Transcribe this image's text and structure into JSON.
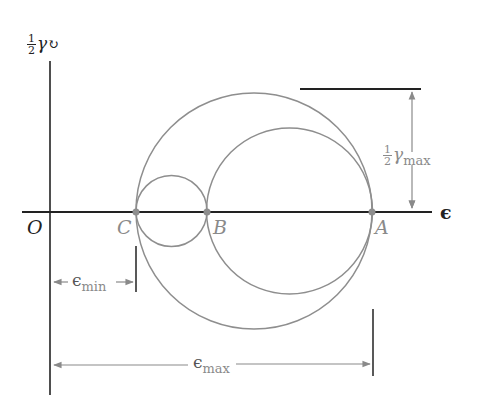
{
  "diagram": {
    "y_axis_label": {
      "fraction_num": "1",
      "fraction_den": "2",
      "symbol": "γ",
      "arrow": "↻"
    },
    "x_axis_label": "ϵ",
    "origin_label": "O",
    "points": [
      {
        "name": "C",
        "x": 136,
        "y": 212
      },
      {
        "name": "B",
        "x": 207,
        "y": 212
      },
      {
        "name": "A",
        "x": 372,
        "y": 212
      }
    ],
    "circles": [
      {
        "name": "large",
        "cx": 254,
        "cy": 211,
        "r": 118
      },
      {
        "name": "medium",
        "cx": 289.5,
        "cy": 211,
        "r": 83
      },
      {
        "name": "small",
        "cx": 171.5,
        "cy": 211,
        "r": 35.5
      }
    ],
    "dimensions": {
      "gamma_max": {
        "num": "1",
        "den": "2",
        "symbol": "γ",
        "sub": "max"
      },
      "eps_min": {
        "symbol": "ϵ",
        "sub": "min"
      },
      "eps_max": {
        "symbol": "ϵ",
        "sub": "max"
      }
    },
    "colors": {
      "axis": "#222222",
      "curve": "#8e8e8e",
      "dimension": "#8a8a8a",
      "point": "#8e8e8e"
    }
  }
}
